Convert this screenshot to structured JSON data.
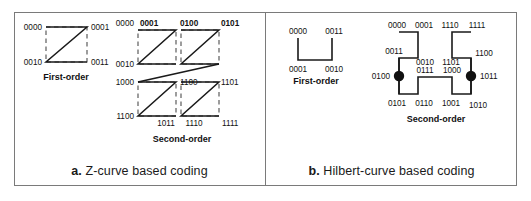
{
  "figure": {
    "panels": [
      {
        "id": "panel-a",
        "caption_prefix": "a.",
        "caption_text": "Z-curve based coding",
        "first_order": {
          "title": "First-order",
          "labels": [
            "0000",
            "0001",
            "0010",
            "0011"
          ]
        },
        "second_order": {
          "title": "Second-order",
          "labels": [
            "0000",
            "0001",
            "0100",
            "0101",
            "0010",
            "1000",
            "1100",
            "1101",
            "1010",
            "1011",
            "1110",
            "1111"
          ]
        }
      },
      {
        "id": "panel-b",
        "caption_prefix": "b.",
        "caption_text": "Hilbert-curve based coding",
        "first_order": {
          "title": "First-order",
          "labels": [
            "0000",
            "0011",
            "0001",
            "0010"
          ]
        },
        "second_order": {
          "title": "Second-order",
          "labels": [
            "0000",
            "0001",
            "1110",
            "1111",
            "0011",
            "0010",
            "1101",
            "1100",
            "0111",
            "1000",
            "0100",
            "1011",
            "0101",
            "0110",
            "1001",
            "1010"
          ]
        }
      }
    ],
    "colors": {
      "frame": "#7a7a7a",
      "stroke": "#1a1a1a",
      "dashed": "#4d4d4d",
      "text": "#111111",
      "background": "#ffffff"
    }
  }
}
